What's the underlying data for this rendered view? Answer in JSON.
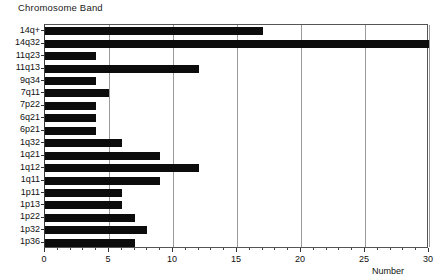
{
  "chart_data": {
    "type": "bar",
    "orientation": "horizontal",
    "title": "Chromosome Band",
    "xlabel": "Number",
    "ylabel": "",
    "xlim": [
      0,
      30
    ],
    "xticks": [
      0,
      5,
      10,
      15,
      20,
      25,
      30
    ],
    "xtick_labels": [
      "0",
      "5",
      "10",
      "15",
      "20",
      "25",
      "30"
    ],
    "minor_tick_interval": 1,
    "grid": true,
    "grid_axis": "x",
    "legend": "none",
    "bar_color": "#0c0c0c",
    "categories": [
      "14q+",
      "14q32",
      "11q23",
      "11q13",
      "9q34",
      "7q11",
      "7p22",
      "6q21",
      "6p21",
      "1q32",
      "1q21",
      "1q12",
      "1q11",
      "1p11",
      "1p13",
      "1p22",
      "1p32",
      "1p36"
    ],
    "values": [
      17,
      30,
      4,
      12,
      4,
      5,
      4,
      4,
      4,
      6,
      9,
      12,
      9,
      6,
      6,
      7,
      8,
      7
    ]
  }
}
